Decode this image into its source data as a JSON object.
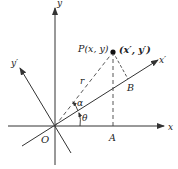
{
  "diagram": {
    "type": "coordinate-rotation",
    "labels": {
      "x_axis": "x",
      "y_axis": "y",
      "x_prime_axis": "x′",
      "y_prime_axis": "y′",
      "origin": "O",
      "point": "P(x, y)",
      "point_prime": "(x′, y′)",
      "radius": "r",
      "alpha": "α",
      "theta": "θ",
      "foot_A": "A",
      "foot_B": "B"
    },
    "colors": {
      "line": "#333333",
      "text": "#222222",
      "background": "#ffffff"
    }
  }
}
